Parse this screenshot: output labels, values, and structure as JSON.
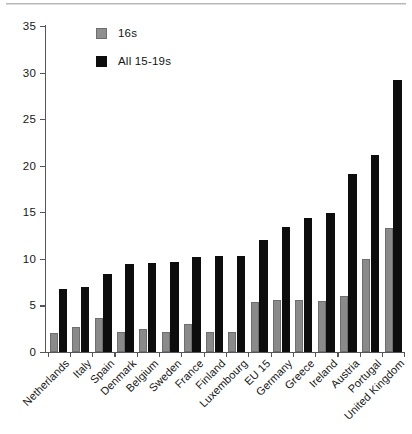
{
  "chart_data": {
    "type": "bar",
    "title": "",
    "subtitle": "",
    "xlabel": "",
    "ylabel": "",
    "ylim": [
      0,
      35
    ],
    "yticks": [
      0,
      5,
      10,
      15,
      20,
      25,
      30,
      35
    ],
    "grid": false,
    "legend_position": "top-left",
    "categories": [
      "Netherlands",
      "Italy",
      "Spain",
      "Denmark",
      "Belgium",
      "Sweden",
      "France",
      "Finland",
      "Luxembourg",
      "EU 15",
      "Germany",
      "Greece",
      "Ireland",
      "Austria",
      "Portugal",
      "United Kingdom"
    ],
    "series": [
      {
        "name": "16s",
        "color": "#8a8a8a",
        "values": [
          2.0,
          2.7,
          3.7,
          2.1,
          2.5,
          2.2,
          3.0,
          2.2,
          2.2,
          5.4,
          5.6,
          5.6,
          5.5,
          6.0,
          10.0,
          13.3
        ]
      },
      {
        "name": "All 15-19s",
        "color": "#0d0d0d",
        "values": [
          6.8,
          7.0,
          8.4,
          9.4,
          9.6,
          9.7,
          10.2,
          10.3,
          10.3,
          12.0,
          13.4,
          14.4,
          14.9,
          19.1,
          21.2,
          29.2
        ]
      }
    ]
  },
  "legend": {
    "items": [
      {
        "label": "16s",
        "color": "#8f8f8f"
      },
      {
        "label": "All 15-19s",
        "color": "#0d0d0d"
      }
    ]
  },
  "axis": {
    "y_tick_labels": [
      "35",
      "30",
      "25",
      "20",
      "15",
      "10",
      "5",
      "0"
    ]
  }
}
